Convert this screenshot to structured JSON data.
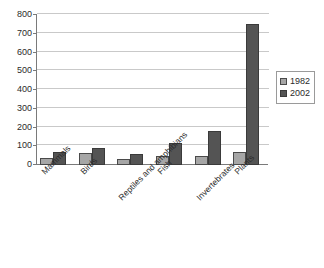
{
  "chart_data": {
    "type": "bar",
    "title": "",
    "subtitle": "",
    "xlabel": "",
    "ylabel": "",
    "ylim": [
      0,
      800
    ],
    "ytick_step": 100,
    "yticks": [
      0,
      100,
      200,
      300,
      400,
      500,
      600,
      700,
      800
    ],
    "ytick_labels": [
      "0",
      "100",
      "200",
      "300",
      "400",
      "500",
      "600",
      "700",
      "800"
    ],
    "grid": true,
    "grid_axis": "y",
    "legend_position": "right",
    "categories": [
      "Mammals",
      "Birds",
      "Reptiles and amphibians",
      "Fish",
      "Invertebrates",
      "Plants"
    ],
    "series": [
      {
        "name": "1982",
        "color": "#a6a6a6",
        "values": [
          35,
          62,
          33,
          50,
          48,
          70
        ]
      },
      {
        "name": "2002",
        "color": "#545454",
        "values": [
          72,
          90,
          58,
          115,
          180,
          750
        ]
      }
    ]
  },
  "legend": {
    "entries": [
      {
        "label": "1982"
      },
      {
        "label": "2002"
      }
    ]
  },
  "colors": {
    "series_1982": "#a6a6a6",
    "series_2002": "#545454",
    "gridline": "#c9c9c9",
    "axis": "#7a7a7a",
    "text": "#2b2b2b",
    "background": "#ffffff"
  }
}
